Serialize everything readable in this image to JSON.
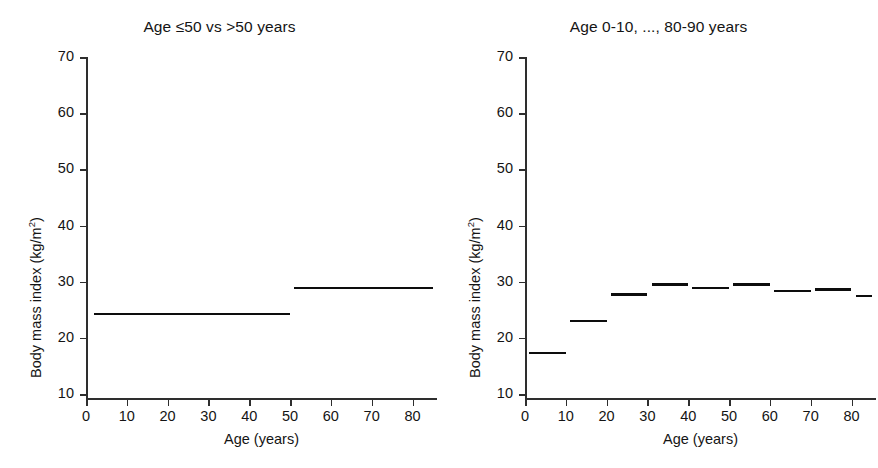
{
  "figure": {
    "background": "#ffffff",
    "point_color": "#c9c9c9",
    "line_color": "#0d0d0d",
    "axis_color": "#2e2e2e"
  },
  "panels": [
    {
      "id": "left",
      "title": "Age ≤50 vs >50 years"
    },
    {
      "id": "right",
      "title": "Age 0-10, ..., 80-90 years"
    }
  ],
  "axes": {
    "x": {
      "label": "Age (years)",
      "ticks": [
        0,
        10,
        20,
        30,
        40,
        50,
        60,
        70,
        80
      ],
      "tick_labels": [
        "0",
        "10",
        "20",
        "30",
        "40",
        "50",
        "60",
        "70",
        "80"
      ],
      "lim": [
        0,
        86
      ]
    },
    "y": {
      "label_main": "Body mass index (kg/m",
      "label_sup": "2",
      "label_tail": ")",
      "label_full": "Body mass index (kg/m2)",
      "ticks": [
        10,
        20,
        30,
        40,
        50,
        60,
        70
      ],
      "tick_labels": [
        "10",
        "20",
        "30",
        "40",
        "50",
        "60",
        "70"
      ],
      "lim": [
        9,
        70
      ]
    }
  },
  "chart_data": {
    "type": "scatter",
    "xlabel": "Age (years)",
    "ylabel": "Body mass index (kg/m2)",
    "xlim": [
      0,
      86
    ],
    "ylim": [
      9,
      70
    ],
    "grid": false,
    "legend": "none",
    "panels": [
      {
        "name": "left",
        "title": "Age ≤50 vs >50 years",
        "fit_type": "step",
        "fit_description": "Mean BMI in two age strata: ≤50 years and >50 years",
        "steps": [
          {
            "x_start": 2,
            "x_end": 50,
            "value": 24.2,
            "label": "≤50 years"
          },
          {
            "x_start": 51,
            "x_end": 85,
            "value": 28.9,
            "label": ">50 years"
          }
        ]
      },
      {
        "name": "right",
        "title": "Age 0-10, ..., 80-90 years",
        "fit_type": "step",
        "fit_description": "Mean BMI within each 10-year age band",
        "steps": [
          {
            "x_start": 1,
            "x_end": 10,
            "value": 17.3,
            "label": "0-10"
          },
          {
            "x_start": 11,
            "x_end": 20,
            "value": 23.0,
            "label": "10-20"
          },
          {
            "x_start": 21,
            "x_end": 30,
            "value": 27.7,
            "label": "20-30"
          },
          {
            "x_start": 31,
            "x_end": 40,
            "value": 29.5,
            "label": "30-40"
          },
          {
            "x_start": 41,
            "x_end": 50,
            "value": 28.9,
            "label": "40-50"
          },
          {
            "x_start": 51,
            "x_end": 60,
            "value": 29.5,
            "label": "50-60"
          },
          {
            "x_start": 61,
            "x_end": 70,
            "value": 28.4,
            "label": "60-70"
          },
          {
            "x_start": 71,
            "x_end": 80,
            "value": 28.6,
            "label": "70-80"
          },
          {
            "x_start": 81,
            "x_end": 85,
            "value": 27.4,
            "label": "80-90"
          }
        ]
      }
    ],
    "series": [
      {
        "name": "Individuals",
        "marker": "circle",
        "color": "#c9c9c9",
        "n_points_approx": 1100,
        "description": "Each point is one subject: age on x, body mass index on y. Identical cloud shown in both panels.",
        "distribution_by_age_band": [
          {
            "band": "0-10",
            "n": 150,
            "bmi_mean": 17.3,
            "bmi_sd": 3.2,
            "bmi_min": 12.0,
            "bmi_max": 28.0
          },
          {
            "band": "10-20",
            "n": 190,
            "bmi_mean": 23.0,
            "bmi_sd": 5.5,
            "bmi_min": 13.0,
            "bmi_max": 45.0
          },
          {
            "band": "20-30",
            "n": 150,
            "bmi_mean": 27.7,
            "bmi_sd": 6.5,
            "bmi_min": 16.0,
            "bmi_max": 55.0
          },
          {
            "band": "30-40",
            "n": 130,
            "bmi_mean": 29.5,
            "bmi_sd": 7.0,
            "bmi_min": 17.0,
            "bmi_max": 59.0
          },
          {
            "band": "40-50",
            "n": 120,
            "bmi_mean": 28.9,
            "bmi_sd": 7.2,
            "bmi_min": 17.0,
            "bmi_max": 63.0
          },
          {
            "band": "50-60",
            "n": 110,
            "bmi_mean": 29.5,
            "bmi_sd": 6.8,
            "bmi_min": 17.0,
            "bmi_max": 57.0
          },
          {
            "band": "60-70",
            "n": 110,
            "bmi_mean": 28.4,
            "bmi_sd": 6.2,
            "bmi_min": 17.0,
            "bmi_max": 46.0
          },
          {
            "band": "70-80",
            "n": 100,
            "bmi_mean": 28.6,
            "bmi_sd": 5.8,
            "bmi_min": 17.0,
            "bmi_max": 44.0
          },
          {
            "band": "80-90",
            "n": 40,
            "bmi_mean": 27.4,
            "bmi_sd": 5.0,
            "bmi_min": 18.0,
            "bmi_max": 42.0
          }
        ]
      }
    ]
  }
}
